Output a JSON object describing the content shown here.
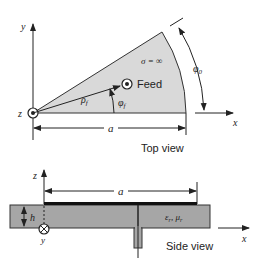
{
  "top_view": {
    "caption": "Top view",
    "axis_y": "y",
    "axis_x": "x",
    "axis_z": "z",
    "conductivity_label": "σ = ∞",
    "feed_label": "Feed",
    "rho_label": "ρ",
    "rho_sub": "f",
    "phi_f_label": "φ",
    "phi_f_sub": "f",
    "phi0_label": "φ",
    "phi0_sub": "0",
    "width_label": "a",
    "sector_fill": "#d9d9d9"
  },
  "side_view": {
    "caption": "Side view",
    "axis_z": "z",
    "axis_x": "x",
    "axis_y": "y",
    "width_label": "a",
    "height_label": "h",
    "material_label": "ε",
    "material_sub_eps": "r",
    "material_mu": ", μ",
    "material_sub_mu": "r",
    "substrate_fill": "#a6a6a6"
  }
}
